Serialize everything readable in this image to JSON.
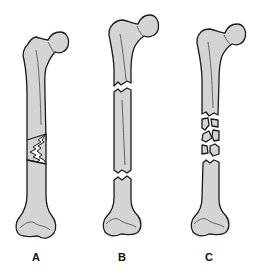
{
  "figure": {
    "colors": {
      "bone_fill": "#d4d4d4",
      "outline": "#1a1a1a",
      "background": "#ffffff"
    },
    "panels": [
      {
        "label": "A",
        "fracture": "oblique / wedge (butterfly fragment)"
      },
      {
        "label": "B",
        "fracture": "segmental (two transverse breaks)"
      },
      {
        "label": "C",
        "fracture": "comminuted (multiple fragments)"
      }
    ]
  }
}
